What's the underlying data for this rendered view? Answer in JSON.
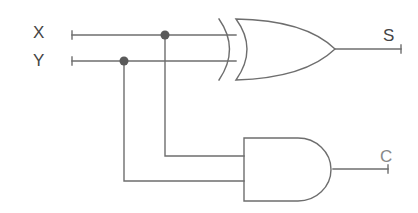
{
  "diagram": {
    "type": "logic-circuit",
    "name": "half-adder",
    "inputs": [
      {
        "id": "X",
        "label": "X"
      },
      {
        "id": "Y",
        "label": "Y"
      }
    ],
    "outputs": [
      {
        "id": "S",
        "label": "S",
        "from_gate": "xor"
      },
      {
        "id": "C",
        "label": "C",
        "from_gate": "and"
      }
    ],
    "gates": [
      {
        "id": "xor",
        "kind": "XOR",
        "inputs": [
          "X",
          "Y"
        ],
        "output": "S"
      },
      {
        "id": "and",
        "kind": "AND",
        "inputs": [
          "X",
          "Y"
        ],
        "output": "C"
      }
    ],
    "colors": {
      "wire": "#6e6e6e",
      "junction": "#5a5a5a",
      "label": "#444444",
      "label_c": "#888888"
    }
  }
}
